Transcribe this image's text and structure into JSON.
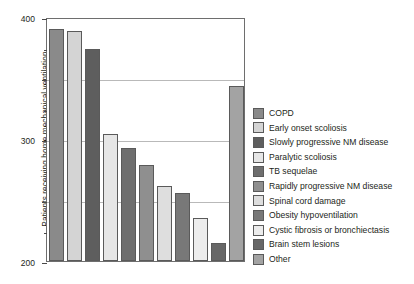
{
  "chart_data": {
    "type": "bar",
    "title": "",
    "xlabel": "",
    "ylabel": "Patients receiving home mechanical ventilation",
    "ylim": [
      0,
      400
    ],
    "yticks": [
      0,
      100,
      200,
      300,
      400
    ],
    "yticklabels": [
      "0",
      "100",
      "200",
      "300",
      "400"
    ],
    "yminorticks": [
      50,
      150,
      250,
      350
    ],
    "grid": "horizontal",
    "legend_position": "right",
    "categories": [
      "COPD",
      "Early onset scoliosis",
      "Slowly progressive NM disease",
      "Paralytic scoliosis",
      "TB sequelae",
      "Rapidly progressive NM disease",
      "Spinal cord damage",
      "Obesity hypoventilation",
      "Cystic fibrosis or bronchiectasis",
      "Brain stem lesions",
      "Other"
    ],
    "values": [
      380,
      377,
      348,
      208,
      186,
      158,
      123,
      112,
      70,
      30,
      287
    ],
    "colors": [
      "#8a8a8a",
      "#d4d4d4",
      "#5e5e5e",
      "#e6e6e6",
      "#6e6e6e",
      "#8f8f8f",
      "#dedede",
      "#787878",
      "#ececec",
      "#676767",
      "#a3a3a3"
    ]
  },
  "legend": {
    "items": [
      {
        "label": "COPD",
        "color": "#8a8a8a"
      },
      {
        "label": "Early onset scoliosis",
        "color": "#d4d4d4"
      },
      {
        "label": "Slowly progressive NM disease",
        "color": "#5e5e5e"
      },
      {
        "label": "Paralytic scoliosis",
        "color": "#e6e6e6"
      },
      {
        "label": "TB sequelae",
        "color": "#6e6e6e"
      },
      {
        "label": "Rapidly progressive NM disease",
        "color": "#8f8f8f"
      },
      {
        "label": "Spinal cord damage",
        "color": "#dedede"
      },
      {
        "label": "Obesity hypoventilation",
        "color": "#787878"
      },
      {
        "label": "Cystic fibrosis or bronchiectasis",
        "color": "#ececec"
      },
      {
        "label": "Brain stem lesions",
        "color": "#676767"
      },
      {
        "label": "Other",
        "color": "#a3a3a3"
      }
    ]
  },
  "style": {
    "frame_color": "#6e6e6e",
    "grid_color": "#b9b9b9",
    "bar_edge_color": "#5a5a5a",
    "text_color": "#231f20",
    "background": "#ffffff"
  }
}
